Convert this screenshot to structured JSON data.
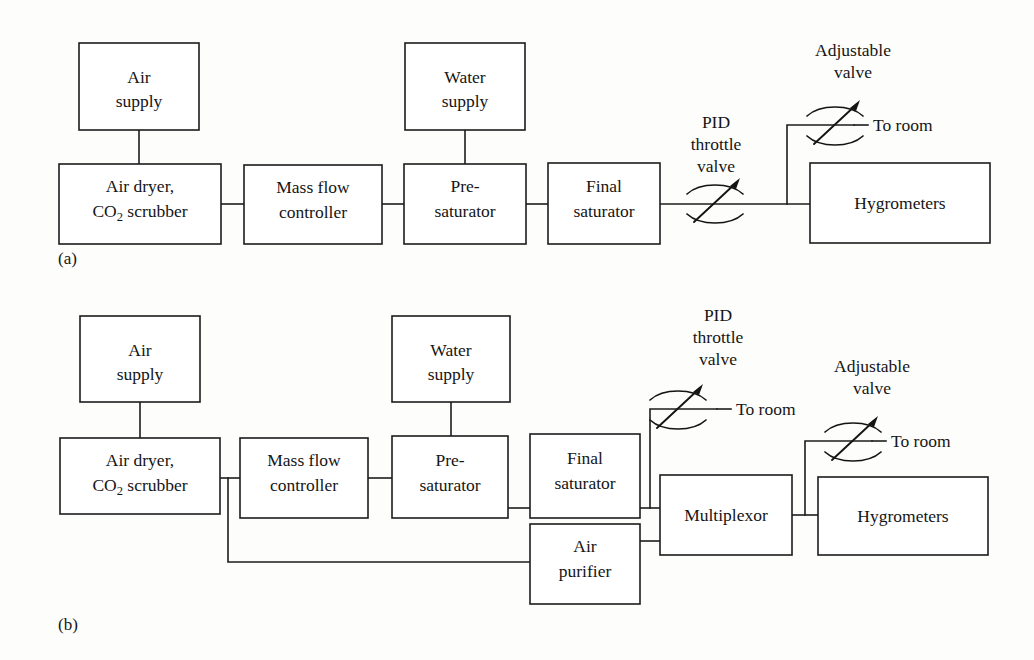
{
  "figure": {
    "background_color": "#fdfdfc",
    "line_color": "#1c1c1c",
    "text_color": "#151515"
  },
  "panels": [
    {
      "caption": "(a)",
      "blocks": {
        "air_supply": "Air\nsupply",
        "air_supply_line1": "Air",
        "air_supply_line2": "supply",
        "air_dryer_line1": "Air dryer,",
        "air_dryer_line2_pre": "CO",
        "air_dryer_line2_sub": "2",
        "air_dryer_line2_post": " scrubber",
        "mass_flow_line1": "Mass flow",
        "mass_flow_line2": "controller",
        "presaturator_line1": "Pre-",
        "presaturator_line2": "saturator",
        "water_supply_line1": "Water",
        "water_supply_line2": "supply",
        "final_saturator_line1": "Final",
        "final_saturator_line2": "saturator",
        "hygrometers": "Hygrometers"
      },
      "annotations": {
        "pid_valve_line1": "PID",
        "pid_valve_line2": "throttle",
        "pid_valve_line3": "valve",
        "adjustable_valve_line1": "Adjustable",
        "adjustable_valve_line2": "valve",
        "to_room": "To room"
      }
    },
    {
      "caption": "(b)",
      "blocks": {
        "air_supply_line1": "Air",
        "air_supply_line2": "supply",
        "air_dryer_line1": "Air dryer,",
        "air_dryer_line2_pre": "CO",
        "air_dryer_line2_sub": "2",
        "air_dryer_line2_post": " scrubber",
        "mass_flow_line1": "Mass flow",
        "mass_flow_line2": "controller",
        "presaturator_line1": "Pre-",
        "presaturator_line2": "saturator",
        "water_supply_line1": "Water",
        "water_supply_line2": "supply",
        "final_saturator_line1": "Final",
        "final_saturator_line2": "saturator",
        "air_purifier_line1": "Air",
        "air_purifier_line2": "purifier",
        "multiplexor": "Multiplexor",
        "hygrometers": "Hygrometers"
      },
      "annotations": {
        "pid_valve_line1": "PID",
        "pid_valve_line2": "throttle",
        "pid_valve_line3": "valve",
        "adjustable_valve_line1": "Adjustable",
        "adjustable_valve_line2": "valve",
        "to_room_pid": "To room",
        "to_room_adjustable": "To room"
      }
    }
  ]
}
